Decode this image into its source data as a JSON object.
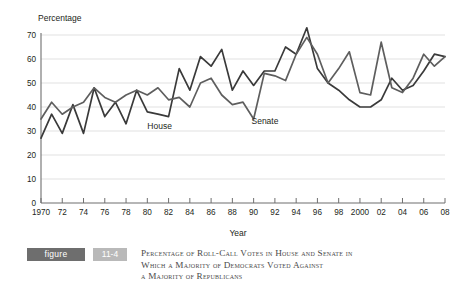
{
  "chart_data": {
    "type": "line",
    "title": "",
    "xlabel": "Year",
    "ylabel": "Percentage",
    "ylim": [
      0,
      70
    ],
    "xlim": [
      1970,
      2008
    ],
    "grid": true,
    "legend_position": "inline-annotations",
    "ytick_labels": [
      "0",
      "10",
      "20",
      "30",
      "40",
      "50",
      "60",
      "70"
    ],
    "ytick_values": [
      0,
      10,
      20,
      30,
      40,
      50,
      60,
      70
    ],
    "xtick_labels": [
      "1970",
      "72",
      "74",
      "76",
      "78",
      "80",
      "82",
      "84",
      "86",
      "88",
      "90",
      "92",
      "94",
      "96",
      "98",
      "2000",
      "02",
      "04",
      "06",
      "08"
    ],
    "xtick_values": [
      1970,
      1972,
      1974,
      1976,
      1978,
      1980,
      1982,
      1984,
      1986,
      1988,
      1990,
      1992,
      1994,
      1996,
      1998,
      2000,
      2002,
      2004,
      2006,
      2008
    ],
    "x": [
      1970,
      1971,
      1972,
      1973,
      1974,
      1975,
      1976,
      1977,
      1978,
      1979,
      1980,
      1981,
      1982,
      1983,
      1984,
      1985,
      1986,
      1987,
      1988,
      1989,
      1990,
      1991,
      1992,
      1993,
      1994,
      1995,
      1996,
      1997,
      1998,
      1999,
      2000,
      2001,
      2002,
      2003,
      2004,
      2005,
      2006,
      2007,
      2008
    ],
    "series": [
      {
        "name": "House",
        "color": "#3a3a3a",
        "values": [
          27,
          37,
          29,
          41,
          29,
          48,
          36,
          42,
          33,
          47,
          38,
          37,
          36,
          56,
          47,
          61,
          57,
          64,
          47,
          55,
          49,
          55,
          55,
          65,
          62,
          73,
          56,
          50,
          47,
          43,
          40,
          40,
          43,
          52,
          47,
          49,
          55,
          62,
          61
        ]
      },
      {
        "name": "Senate",
        "color": "#5e5e5e",
        "values": [
          35,
          42,
          37,
          40,
          42,
          48,
          44,
          42,
          45,
          47,
          45,
          48,
          43,
          44,
          40,
          50,
          52,
          45,
          41,
          42,
          35,
          54,
          53,
          51,
          62,
          69,
          62,
          50,
          56,
          63,
          46,
          45,
          67,
          48,
          46,
          52,
          62,
          57,
          61
        ]
      }
    ],
    "annotations": [
      {
        "label": "House",
        "x": 1980.0,
        "y": 31.0
      },
      {
        "label": "Senate",
        "x": 1989.8,
        "y": 33.0
      }
    ]
  },
  "figure": {
    "badge_label": "figure",
    "number_label": "11-4",
    "caption_lines": [
      "Percentage of Roll-Call Votes in House and Senate in",
      "Which a Majority of Democrats Voted Against",
      "a Majority of Republicans"
    ]
  }
}
